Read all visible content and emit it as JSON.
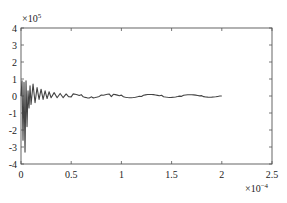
{
  "chart_data": {
    "type": "line",
    "title": "",
    "xlabel": "",
    "ylabel": "",
    "x_multiplier": "×10",
    "x_multiplier_exp": "−4",
    "y_multiplier": "×10",
    "y_multiplier_exp": "5",
    "xlim": [
      0,
      2.5
    ],
    "ylim": [
      -4,
      4
    ],
    "x_ticks": [
      "0",
      "0.5",
      "1",
      "1.5",
      "2",
      "2.5"
    ],
    "y_ticks": [
      "4",
      "3",
      "2",
      "1",
      "0",
      "-1",
      "-2",
      "-3",
      "-4"
    ],
    "grid": false,
    "legend": null,
    "series": [
      {
        "name": "signal",
        "color": "#444444",
        "description": "Damped oscillation: large initial swings (~+1 to -3.3 ×10^5) near t=0, decaying to small ripple (~±0.1 ×10^5) by t≈0.5×10^-4, continuing until t=2×10^-4",
        "x": [
          0,
          0.01,
          0.02,
          0.03,
          0.04,
          0.05,
          0.06,
          0.07,
          0.08,
          0.09,
          0.1,
          0.12,
          0.14,
          0.16,
          0.18,
          0.2,
          0.22,
          0.24,
          0.26,
          0.28,
          0.3,
          0.33,
          0.36,
          0.39,
          0.42,
          0.45,
          0.5,
          0.6,
          0.7,
          0.8,
          0.9,
          1.0,
          1.2,
          1.4,
          1.6,
          1.8,
          2.0
        ],
        "values": [
          0,
          0.9,
          -2.6,
          0.8,
          -3.3,
          0.9,
          -1.8,
          0.3,
          -0.7,
          0.6,
          -0.5,
          0.7,
          -0.4,
          0.5,
          -0.2,
          0.4,
          -0.2,
          0.3,
          -0.15,
          0.25,
          -0.1,
          0.2,
          -0.1,
          0.15,
          -0.1,
          0.12,
          -0.05,
          0.08,
          -0.05,
          0.06,
          -0.04,
          0.05,
          -0.03,
          0.04,
          -0.02,
          0.02,
          0.0
        ]
      }
    ]
  }
}
